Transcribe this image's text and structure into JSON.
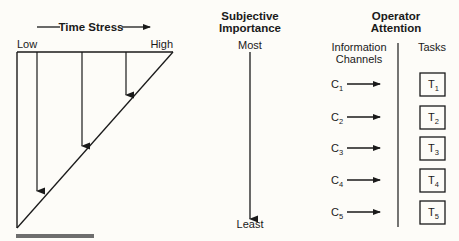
{
  "time_stress": {
    "title": "Time Stress",
    "low_label": "Low",
    "high_label": "High"
  },
  "importance": {
    "title_line1": "Subjective",
    "title_line2": "Importance",
    "top_label": "Most",
    "bottom_label": "Least"
  },
  "attention": {
    "title_line1": "Operator",
    "title_line2": "Attention",
    "channels_header_line1": "Information",
    "channels_header_line2": "Channels",
    "tasks_header": "Tasks",
    "channels": [
      {
        "letter": "C",
        "sub": "1"
      },
      {
        "letter": "C",
        "sub": "2"
      },
      {
        "letter": "C",
        "sub": "3"
      },
      {
        "letter": "C",
        "sub": "4"
      },
      {
        "letter": "C",
        "sub": "5"
      }
    ],
    "tasks": [
      {
        "letter": "T",
        "sub": "1"
      },
      {
        "letter": "T",
        "sub": "2"
      },
      {
        "letter": "T",
        "sub": "3"
      },
      {
        "letter": "T",
        "sub": "4"
      },
      {
        "letter": "T",
        "sub": "5"
      }
    ]
  },
  "colors": {
    "ink": "#1a1a1a",
    "footer_bar": "#6e6e6e",
    "background": "#fdfcf8"
  }
}
